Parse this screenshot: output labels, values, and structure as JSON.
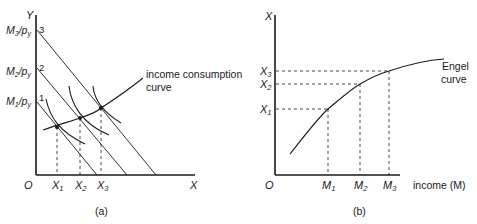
{
  "panel_a": {
    "caption": "(a)",
    "axis_y_label": "Y",
    "axis_x_label": "X",
    "origin_label": "O",
    "intercepts": [
      {
        "num": "M",
        "sub": "1",
        "den": "/p",
        "den_sub": "y",
        "line_label": "1"
      },
      {
        "num": "M",
        "sub": "2",
        "den": "/p",
        "den_sub": "y",
        "line_label": "2"
      },
      {
        "num": "M",
        "sub": "3",
        "den": "/p",
        "den_sub": "y",
        "line_label": "3"
      }
    ],
    "x_ticks": [
      {
        "main": "X",
        "sub": "1"
      },
      {
        "main": "X",
        "sub": "2"
      },
      {
        "main": "X",
        "sub": "3"
      }
    ],
    "curve_label_line1": "income consumption",
    "curve_label_line2": "curve"
  },
  "panel_b": {
    "caption": "(b)",
    "axis_y_label": "X",
    "axis_x_label": "income (M)",
    "origin_label": "O",
    "y_ticks": [
      {
        "main": "X",
        "sub": "1"
      },
      {
        "main": "X",
        "sub": "2"
      },
      {
        "main": "X",
        "sub": "3"
      }
    ],
    "x_ticks": [
      {
        "main": "M",
        "sub": "1"
      },
      {
        "main": "M",
        "sub": "2"
      },
      {
        "main": "M",
        "sub": "3"
      }
    ],
    "curve_label_line1": "Engel",
    "curve_label_line2": "curve"
  },
  "colors": {
    "ink": "#1a1a1a",
    "background": "#ffffff"
  }
}
